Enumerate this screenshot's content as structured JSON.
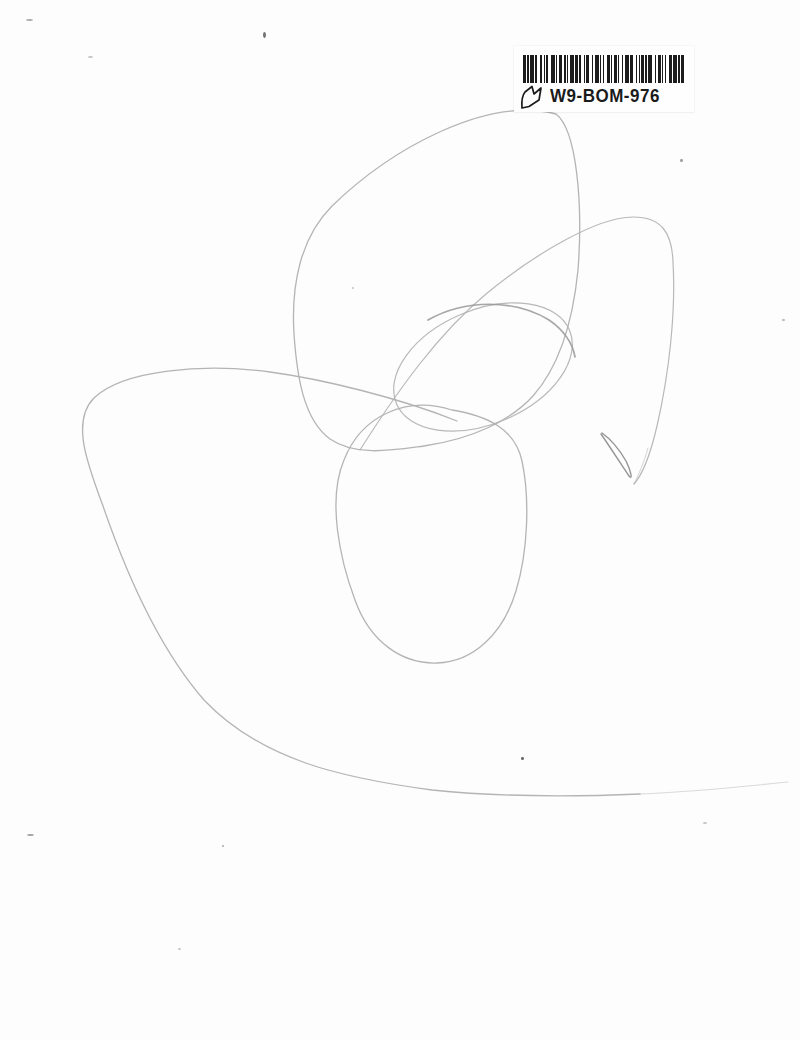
{
  "barcode": {
    "code": "W9-BOM-976",
    "pattern": [
      2,
      1,
      1,
      1,
      3,
      1,
      1,
      2,
      2,
      1,
      1,
      1,
      1,
      2,
      3,
      1,
      1,
      1,
      2,
      2,
      1,
      1,
      1,
      1,
      3,
      1,
      2,
      1,
      1,
      2,
      1,
      1,
      2,
      2,
      1,
      1,
      3,
      1,
      1,
      1,
      1,
      2,
      2,
      1,
      1,
      1,
      2,
      1,
      1,
      2,
      1,
      1,
      3,
      1,
      2,
      2,
      1,
      1,
      1,
      1,
      2,
      1,
      1,
      1,
      3,
      2,
      1,
      1,
      2,
      1,
      1,
      1,
      1,
      2,
      2,
      1,
      3,
      1,
      1,
      1,
      2
    ],
    "bar_color": "#1c1c1c",
    "height_px": 28,
    "width_px": 161
  },
  "colors": {
    "paper": "#fdfdfd",
    "pencil_light": "#b0b0b0",
    "pencil_mid": "#989898",
    "pencil_dark": "#8a8a8a"
  },
  "scribble": {
    "stroke_width": 1.3,
    "shapes": [
      {
        "type": "path",
        "color": "pencil_light",
        "w": 1.3,
        "opacity": 0.95,
        "d": "M 556,114 C 487,96 392,148 332,206 C 300,238 291,286 294,334 C 297,378 304,420 330,439 C 356,457 394,450 424,446 C 472,439 510,421 533,396 C 556,370 572,330 578,270 C 583,205 577,130 556,114 Z"
      },
      {
        "type": "path",
        "color": "pencil_light",
        "w": 1.2,
        "opacity": 0.9,
        "d": "M 360,450 C 398,390 438,334 486,294 C 532,256 596,217 633,217 C 661,217 672,232 673,262 C 676,312 669,374 657,426 C 650,456 643,474 634,484"
      },
      {
        "type": "ellipse",
        "color": "pencil_light",
        "w": 1.2,
        "opacity": 0.9,
        "cx": 483,
        "cy": 367,
        "rx": 94,
        "ry": 57,
        "rot": -23
      },
      {
        "type": "path",
        "color": "pencil_mid",
        "w": 1.7,
        "opacity": 0.85,
        "d": "M 428,320 C 465,299 515,299 549,320 C 564,330 573,344 575,357"
      },
      {
        "type": "path",
        "color": "pencil_light",
        "w": 1.3,
        "opacity": 0.95,
        "d": "M 452,410 C 408,396 362,414 344,460 C 327,500 340,560 355,600 C 370,642 402,664 437,663 C 473,662 503,634 516,591 C 528,551 530,499 522,461 C 515,429 488,416 452,410 Z"
      },
      {
        "type": "path",
        "color": "pencil_light",
        "w": 1.3,
        "opacity": 0.95,
        "d": "M 457,421 C 400,398 322,379 270,372 C 203,363 123,370 94,398 C 71,421 87,463 103,506 C 125,570 157,646 204,700 C 261,760 342,778 432,790 C 500,797 570,797 640,794"
      },
      {
        "type": "path",
        "color": "pencil_light",
        "w": 1.1,
        "opacity": 0.45,
        "d": "M 640,794 C 690,792 740,787 788,782"
      },
      {
        "type": "path",
        "color": "pencil_dark",
        "w": 1.4,
        "opacity": 0.9,
        "d": "M 601,434 C 610,447 621,464 629,476 C 633,481 631,471 626,461 C 618,447 609,438 602,433"
      },
      {
        "type": "path",
        "color": "pencil_light",
        "w": 1.0,
        "opacity": 0.55,
        "d": "M 648,448 C 644,462 639,474 634,484"
      }
    ]
  },
  "specks": [
    {
      "x": 26,
      "y": 19,
      "w": 7,
      "h": 2,
      "o": 0.45
    },
    {
      "x": 263,
      "y": 32,
      "w": 3,
      "h": 6,
      "o": 0.75
    },
    {
      "x": 88,
      "y": 56,
      "w": 5,
      "h": 2,
      "o": 0.3
    },
    {
      "x": 680,
      "y": 159,
      "w": 3,
      "h": 3,
      "o": 0.5
    },
    {
      "x": 782,
      "y": 319,
      "w": 3,
      "h": 2,
      "o": 0.4
    },
    {
      "x": 352,
      "y": 287,
      "w": 2,
      "h": 2,
      "o": 0.3
    },
    {
      "x": 521,
      "y": 757,
      "w": 3,
      "h": 3,
      "o": 0.8
    },
    {
      "x": 27,
      "y": 834,
      "w": 7,
      "h": 2,
      "o": 0.5
    },
    {
      "x": 222,
      "y": 845,
      "w": 2,
      "h": 2,
      "o": 0.45
    },
    {
      "x": 178,
      "y": 948,
      "w": 3,
      "h": 2,
      "o": 0.3
    },
    {
      "x": 703,
      "y": 822,
      "w": 4,
      "h": 2,
      "o": 0.3
    }
  ]
}
